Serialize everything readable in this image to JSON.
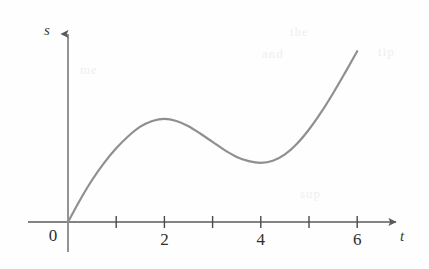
{
  "figure": {
    "title": "",
    "background_color": "#fefefe"
  },
  "chart_data": {
    "type": "line",
    "title": "",
    "xlabel": "t",
    "ylabel": "s",
    "grid": false,
    "legend": null,
    "xlim": [
      0,
      6.3
    ],
    "ylim": [
      0,
      5.2
    ],
    "x_ticks": [
      0,
      1,
      2,
      3,
      4,
      5,
      6
    ],
    "x_tick_labels": [
      "0",
      "",
      "2",
      "",
      "4",
      "",
      "6"
    ],
    "y_ticks": [],
    "y_tick_labels": [],
    "axis_arrows": {
      "x": true,
      "y": true
    },
    "series": [
      {
        "name": "s(t)",
        "color": "#8f8f8f",
        "line_width": 2.2,
        "x": [
          0,
          0.25,
          0.5,
          0.75,
          1.0,
          1.25,
          1.5,
          1.75,
          2.0,
          2.25,
          2.5,
          2.75,
          3.0,
          3.25,
          3.5,
          3.75,
          4.0,
          4.25,
          4.5,
          4.75,
          5.0,
          5.25,
          5.5,
          5.75,
          6.0
        ],
        "y": [
          0.0,
          0.62,
          1.18,
          1.66,
          2.07,
          2.41,
          2.68,
          2.84,
          2.9,
          2.84,
          2.69,
          2.48,
          2.25,
          2.02,
          1.83,
          1.71,
          1.66,
          1.72,
          1.9,
          2.2,
          2.6,
          3.08,
          3.62,
          4.2,
          4.8
        ]
      }
    ],
    "annotations": {
      "local_max": {
        "t": 2,
        "label": "local maximum"
      },
      "local_min": {
        "t": 4,
        "label": "local minimum"
      },
      "origin": {
        "t": 0,
        "label": "0"
      }
    }
  },
  "axis_labels": {
    "y_axis": "s",
    "x_axis": "t",
    "origin": "0",
    "tick_2": "2",
    "tick_4": "4",
    "tick_6": "6"
  },
  "colors": {
    "curve": "#8f8f8f",
    "axis": "#5a5a5a",
    "tick": "#4a4a4a",
    "text": "#2e2e2e",
    "ghost": "#efefef"
  },
  "ghost_text": {
    "g1": "the",
    "g2": "and",
    "g3": "tip",
    "g4": "sup",
    "g5": "me"
  }
}
